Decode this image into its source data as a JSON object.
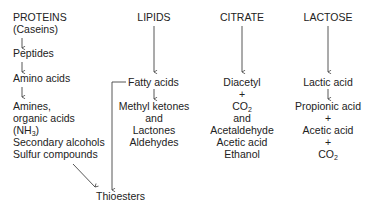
{
  "columns": {
    "proteins": {
      "header": "PROTEINS",
      "subheader": "(Caseins)",
      "steps": [
        "Peptides",
        "Amino acids"
      ],
      "products": [
        "Amines,",
        "organic acids",
        "(NH3)",
        "Secondary alcohols",
        "Sulfur compounds"
      ]
    },
    "lipids": {
      "header": "LIPIDS",
      "intermediate": "Fatty acids",
      "products": [
        "Methyl ketones",
        "and",
        "Lactones",
        "Aldehydes"
      ]
    },
    "citrate": {
      "header": "CITRATE",
      "products": [
        "Diacetyl",
        "+",
        "CO2",
        "and",
        "Acetaldehyde",
        "Acetic acid",
        "Ethanol"
      ]
    },
    "lactose": {
      "header": "LACTOSE",
      "products": [
        "Lactic acid",
        "Propionic acid",
        "+",
        "Acetic acid",
        "+",
        "CO2"
      ]
    }
  },
  "convergence": {
    "label": "Thioesters",
    "sources": [
      "Sulfur compounds",
      "Fatty acids"
    ]
  },
  "arrow_glyph": "↓",
  "plus_glyph": "+"
}
